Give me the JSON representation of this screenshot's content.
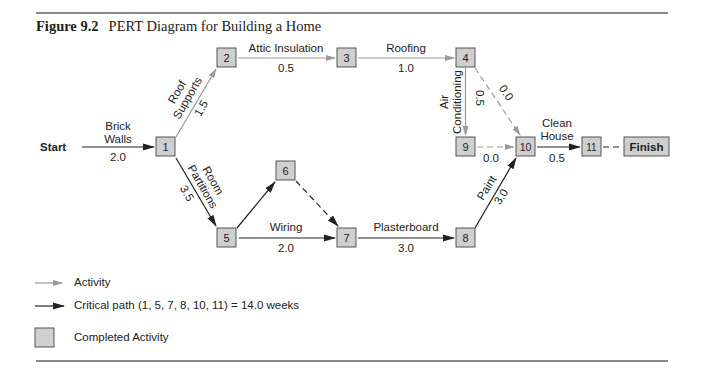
{
  "figure": {
    "number": "Figure 9.2",
    "title": "PERT Diagram for Building a Home"
  },
  "colors": {
    "node_fill": "#cfcfcf",
    "node_border": "#555555",
    "activity_line": "#9a9a9a",
    "critical_line": "#222222",
    "rule": "#8a8a8a"
  },
  "endpoints": {
    "start": "Start",
    "finish": "Finish"
  },
  "nodes": [
    {
      "id": "1"
    },
    {
      "id": "2"
    },
    {
      "id": "3"
    },
    {
      "id": "4"
    },
    {
      "id": "5"
    },
    {
      "id": "6"
    },
    {
      "id": "7"
    },
    {
      "id": "8"
    },
    {
      "id": "9"
    },
    {
      "id": "10"
    },
    {
      "id": "11"
    }
  ],
  "activities": {
    "brick_walls": {
      "line1": "Brick",
      "line2": "Walls",
      "duration": "2.0",
      "from": "Start",
      "to": "1",
      "critical": true
    },
    "roof_supports": {
      "line1": "Roof",
      "line2": "Supports",
      "duration": "1.5",
      "from": "1",
      "to": "2",
      "critical": false
    },
    "attic_insulation": {
      "label": "Attic Insulation",
      "duration": "0.5",
      "from": "2",
      "to": "3",
      "critical": false
    },
    "roofing": {
      "label": "Roofing",
      "duration": "1.0",
      "from": "3",
      "to": "4",
      "critical": false
    },
    "air_conditioning": {
      "line1": "Air",
      "line2": "Conditioning",
      "duration": "0.5",
      "from": "4",
      "to": "9",
      "critical": false
    },
    "dummy_4_10": {
      "duration": "0.0",
      "from": "4",
      "to": "10",
      "dummy": true
    },
    "dummy_9_10": {
      "duration": "0.0",
      "from": "9",
      "to": "10",
      "dummy": true
    },
    "room_partitions": {
      "line1": "Room",
      "line2": "Partitions",
      "duration": "3.5",
      "from": "1",
      "to": "5",
      "critical": true
    },
    "wiring": {
      "label": "Wiring",
      "duration": "2.0",
      "from": "5",
      "to": "7",
      "critical": true
    },
    "edge_5_6": {
      "from": "5",
      "to": "6",
      "critical": true
    },
    "dummy_6_7": {
      "from": "6",
      "to": "7",
      "dummy": true
    },
    "plasterboard": {
      "label": "Plasterboard",
      "duration": "3.0",
      "from": "7",
      "to": "8",
      "critical": true
    },
    "paint": {
      "label": "Paint",
      "duration": "3.0",
      "from": "8",
      "to": "10",
      "critical": true
    },
    "clean_house": {
      "line1": "Clean",
      "line2": "House",
      "duration": "0.5",
      "from": "10",
      "to": "11",
      "critical": true
    },
    "dummy_11_finish": {
      "from": "11",
      "to": "Finish",
      "dummy": true
    }
  },
  "legend": {
    "activity": "Activity",
    "critical_path": "Critical path (1, 5, 7, 8, 10, 11) = 14.0 weeks",
    "completed": "Completed Activity"
  }
}
